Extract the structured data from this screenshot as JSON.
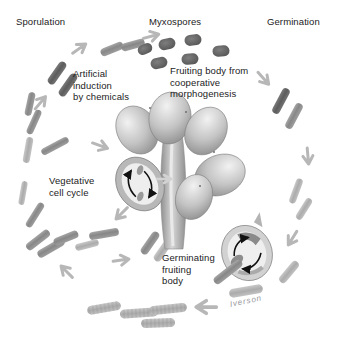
{
  "labels": {
    "sporulation": "Sporulation",
    "myxospores": "Myxospores",
    "germination": "Germination",
    "artificial_induction": "Artificial\ninduction\nby chemicals",
    "fruiting_body_caption": "Fruiting body from\ncooperative\nmorphogenesis",
    "vegetative_cell_cycle": "Vegetative\ncell cycle",
    "germinating_fruiting_body": "Germinating\nfruiting\nbody"
  },
  "signature": "Iverson",
  "colors": {
    "background": "#ffffff",
    "label_text": "#1b1b1b",
    "signature_text": "#96969b",
    "cycle_arrow": "#b7b7b7",
    "black_arrow": "#111111",
    "myxospore_dark": "#585858",
    "rod_cell_medium": "#8c8c8c",
    "rod_cell_light": "#b4b4b4",
    "fruiting_body_highlight": "#f1f1f1",
    "fruiting_body_shadow": "#8a8a8a"
  }
}
